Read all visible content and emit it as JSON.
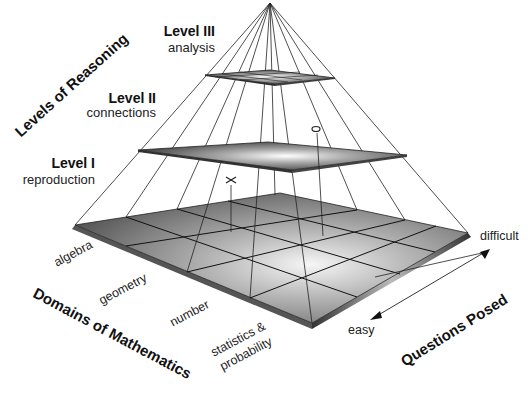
{
  "axes": {
    "vertical_title": "Levels of Reasoning",
    "domains_title": "Domains of Mathematics",
    "questions_title": "Questions Posed"
  },
  "levels": [
    {
      "title": "Level III",
      "subtitle": "analysis"
    },
    {
      "title": "Level II",
      "subtitle": "connections"
    },
    {
      "title": "Level I",
      "subtitle": "reproduction"
    }
  ],
  "domains": [
    "algebra",
    "geometry",
    "number",
    "statistics &",
    "probability"
  ],
  "questions": {
    "low": "easy",
    "high": "difficult"
  },
  "markers": [
    {
      "symbol": "x"
    },
    {
      "symbol": "o"
    }
  ],
  "colors": {
    "plane_dark": "#4a4a4a",
    "plane_light": "#f2f2f2",
    "line": "#222222"
  }
}
